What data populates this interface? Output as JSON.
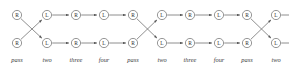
{
  "diagram": {
    "type": "braid-permutation-network",
    "background_color": "#ffffff",
    "node_stroke_color": "#6a6a6a",
    "edge_color": "#6a6a6a",
    "label_color": "#2b2b2b",
    "caption_color": "#3a3a3a",
    "columns": 10,
    "rows": 2,
    "column_x": [
      17,
      47,
      76,
      104,
      133,
      162,
      190,
      219,
      247,
      276
    ],
    "row_y": [
      15,
      43
    ],
    "node_radius": 4.6,
    "top_row": {
      "labels": [
        "R",
        "L",
        "R",
        "L",
        "R",
        "L",
        "R",
        "L",
        "R",
        "L"
      ]
    },
    "bottom_row": {
      "labels": [
        "R",
        "L",
        "R",
        "L",
        "R",
        "L",
        "R",
        "L",
        "R",
        "L"
      ]
    },
    "captions": [
      "pass",
      "two",
      "three",
      "four",
      "pass",
      "two",
      "three",
      "four",
      "pass",
      "two"
    ],
    "caption_y": 62,
    "edges": [
      {
        "from_col": 0,
        "from_row": 0,
        "to_col": 1,
        "to_row": 1,
        "kind": "cross"
      },
      {
        "from_col": 0,
        "from_row": 1,
        "to_col": 1,
        "to_row": 0,
        "kind": "cross"
      },
      {
        "from_col": 1,
        "from_row": 0,
        "to_col": 2,
        "to_row": 0,
        "kind": "straight"
      },
      {
        "from_col": 1,
        "from_row": 1,
        "to_col": 2,
        "to_row": 1,
        "kind": "straight"
      },
      {
        "from_col": 2,
        "from_row": 0,
        "to_col": 3,
        "to_row": 0,
        "kind": "straight"
      },
      {
        "from_col": 2,
        "from_row": 1,
        "to_col": 3,
        "to_row": 1,
        "kind": "straight"
      },
      {
        "from_col": 3,
        "from_row": 0,
        "to_col": 4,
        "to_row": 0,
        "kind": "straight"
      },
      {
        "from_col": 3,
        "from_row": 1,
        "to_col": 4,
        "to_row": 1,
        "kind": "straight"
      },
      {
        "from_col": 4,
        "from_row": 0,
        "to_col": 5,
        "to_row": 1,
        "kind": "cross"
      },
      {
        "from_col": 4,
        "from_row": 1,
        "to_col": 5,
        "to_row": 0,
        "kind": "cross"
      },
      {
        "from_col": 5,
        "from_row": 0,
        "to_col": 6,
        "to_row": 0,
        "kind": "straight"
      },
      {
        "from_col": 5,
        "from_row": 1,
        "to_col": 6,
        "to_row": 1,
        "kind": "straight"
      },
      {
        "from_col": 6,
        "from_row": 0,
        "to_col": 7,
        "to_row": 0,
        "kind": "straight"
      },
      {
        "from_col": 6,
        "from_row": 1,
        "to_col": 7,
        "to_row": 1,
        "kind": "straight"
      },
      {
        "from_col": 7,
        "from_row": 0,
        "to_col": 8,
        "to_row": 0,
        "kind": "straight"
      },
      {
        "from_col": 7,
        "from_row": 1,
        "to_col": 8,
        "to_row": 1,
        "kind": "straight"
      },
      {
        "from_col": 8,
        "from_row": 0,
        "to_col": 9,
        "to_row": 1,
        "kind": "cross"
      },
      {
        "from_col": 8,
        "from_row": 1,
        "to_col": 9,
        "to_row": 0,
        "kind": "cross"
      }
    ],
    "tail_edges": [
      {
        "from_col": 9,
        "from_row": 0,
        "length": 12
      },
      {
        "from_col": 9,
        "from_row": 1,
        "length": 12
      }
    ]
  }
}
